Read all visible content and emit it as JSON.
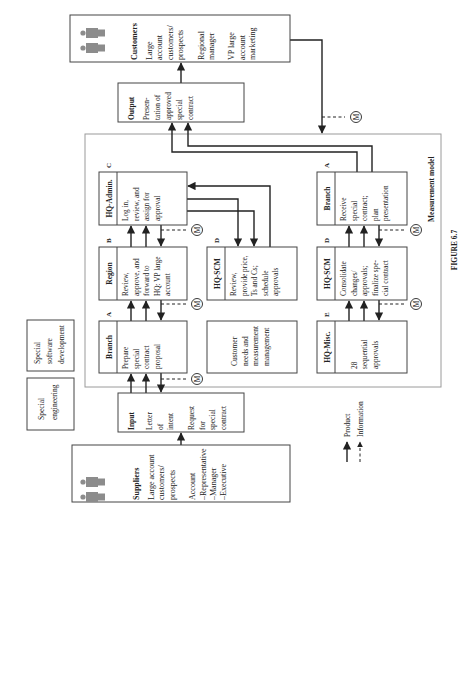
{
  "figure_caption": "FIGURE 6.7",
  "frame_label": "Measurement model",
  "suppliers": {
    "title": "Suppliers",
    "lines": [
      "Large account",
      "customers/",
      "prospects",
      "",
      "Account",
      "–Representative",
      "–Manager",
      "–Executive"
    ],
    "icon": "people-icon"
  },
  "customers": {
    "title": "Customers",
    "lines": [
      "Large",
      "account",
      "customers/",
      "prospects",
      "",
      "Regional",
      "manager",
      "",
      "VP large",
      "account",
      "marketing"
    ],
    "icon": "people-icon"
  },
  "input": {
    "title": "Input",
    "lines": [
      "Letter",
      "of",
      "intent",
      "",
      "Request",
      "for",
      "special",
      "contract"
    ]
  },
  "output": {
    "title": "Output",
    "lines": [
      "Presen-",
      "tation of",
      "approved",
      "special",
      "contract"
    ]
  },
  "side_boxes": [
    {
      "lines": [
        "Special",
        "engineering"
      ]
    },
    {
      "lines": [
        "Special",
        "software",
        "development"
      ]
    }
  ],
  "process_boxes": [
    {
      "id": "branch-a-1",
      "title": "Branch",
      "tag": "A",
      "lines": [
        "Prepare",
        "special",
        "contract",
        "proposal"
      ]
    },
    {
      "id": "region-b",
      "title": "Region",
      "tag": "B",
      "lines": [
        "Review,",
        "approve, and",
        "forward to",
        "HQ: VP large",
        "account"
      ]
    },
    {
      "id": "hq-admin-c",
      "title": "HQ-Admin.",
      "tag": "C",
      "lines": [
        "Log in,",
        "review, and",
        "assign for",
        "approval"
      ]
    },
    {
      "id": "hq-scm-d-1",
      "title": "HQ-SCM",
      "tag": "D",
      "lines": [
        "Review,",
        "provide price,",
        "Ts and Cs;",
        "schedule",
        "approvals"
      ]
    },
    {
      "id": "hq-misc-e",
      "title": "HQ-Misc.",
      "tag": "E",
      "lines": [
        "",
        "28",
        "sequential",
        "approvals"
      ]
    },
    {
      "id": "hq-scm-d-2",
      "title": "HQ-SCM",
      "tag": "D",
      "lines": [
        "Consolidate",
        "changes/",
        "approvals;",
        "finalize spe-",
        "cial contract"
      ]
    },
    {
      "id": "branch-a-2",
      "title": "Branch",
      "tag": "A",
      "lines": [
        "Receive",
        "special",
        "contract;",
        "plan",
        "presentation"
      ]
    }
  ],
  "customer_needs_box": {
    "lines": [
      "Customer",
      "needs and",
      "measurement",
      "management"
    ]
  },
  "measurement_marker": "M",
  "legend": {
    "items": [
      {
        "label": "Product",
        "style": "solid"
      },
      {
        "label": "Information",
        "style": "dashed"
      }
    ]
  },
  "colors": {
    "line": "#222222",
    "frame": "#9a9a9a",
    "icon": "#8c8c8c"
  }
}
